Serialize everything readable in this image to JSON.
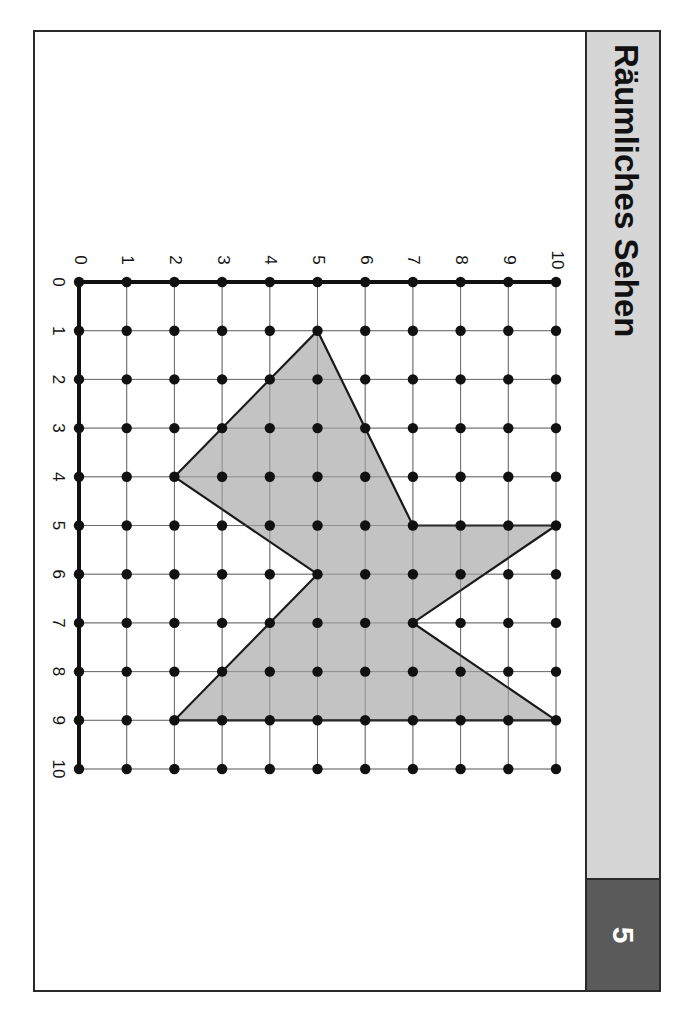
{
  "header": {
    "title": "Räumliches Sehen",
    "page_number": "5"
  },
  "colors": {
    "header_bg": "#d6d6d6",
    "page_box_bg": "#5a5a5a",
    "shape_fill": "#b8b8b8",
    "line": "#1a1a1a"
  },
  "grid": {
    "orientation": "rotated 90° clockwise",
    "top_axis_labels": [
      "0",
      "1",
      "2",
      "3",
      "4",
      "5",
      "6",
      "7",
      "8",
      "9",
      "10"
    ],
    "left_axis_labels": [
      "0",
      "1",
      "2",
      "3",
      "4",
      "5",
      "6",
      "7",
      "8",
      "9",
      "10"
    ],
    "range": [
      0,
      10
    ],
    "dots_per_intersection": true
  },
  "shape": {
    "description": "Shaded polygon on geoboard grid (x = top-axis value, y = left-axis value)",
    "vertices": [
      [
        5,
        1
      ],
      [
        7,
        5
      ],
      [
        10,
        5
      ],
      [
        7,
        7
      ],
      [
        10,
        9
      ],
      [
        2,
        9
      ],
      [
        5,
        6
      ],
      [
        2,
        4
      ]
    ]
  }
}
